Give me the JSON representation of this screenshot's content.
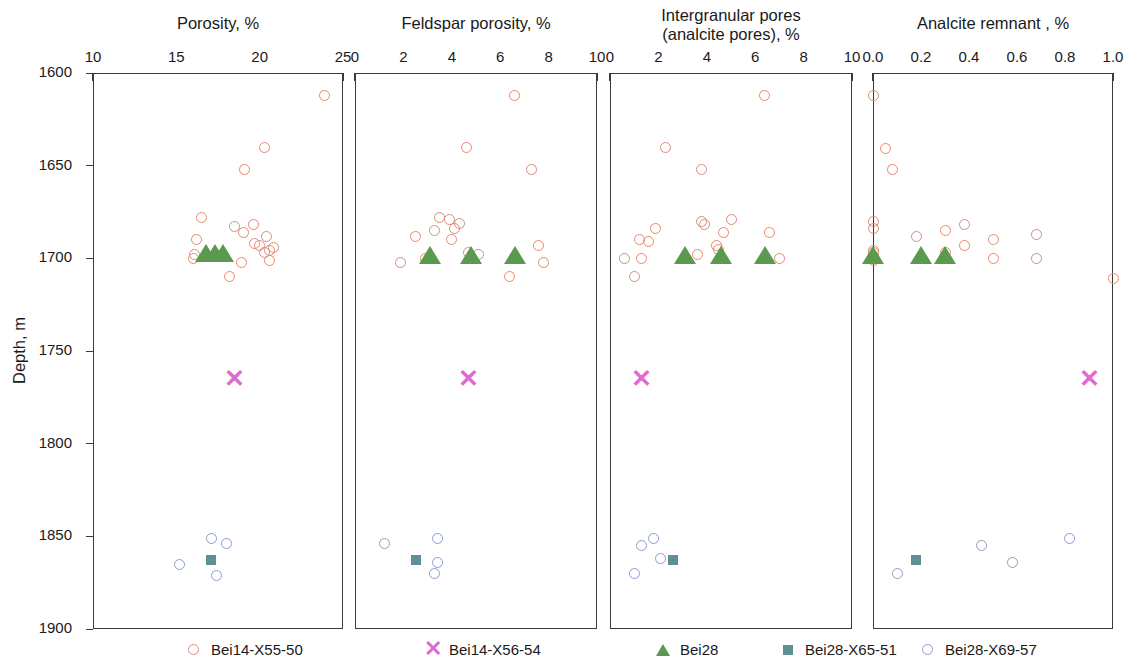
{
  "figure": {
    "y_axis_label": "Depth, m",
    "y_ticks": [
      "1600",
      "1650",
      "1700",
      "1750",
      "1800",
      "1850",
      "1900"
    ],
    "y_min": 1600,
    "y_max": 1900
  },
  "legend": {
    "entries": [
      {
        "label": "Bei14-X55-50",
        "marker": "open-circle",
        "color": "#e08a70"
      },
      {
        "label": "Bei14-X56-54",
        "marker": "cross",
        "color": "#e06bd0"
      },
      {
        "label": "Bei28",
        "marker": "filled-triangle",
        "color": "#5a9a4f"
      },
      {
        "label": "Bei28-X65-51",
        "marker": "filled-square",
        "color": "#5f9098"
      },
      {
        "label": "Bei28-X69-57",
        "marker": "open-circle",
        "color": "#8e9ccc"
      }
    ]
  },
  "chart_data": [
    {
      "type": "scatter",
      "title": "Porosity, %",
      "xlabel": "Porosity, %",
      "ylabel": "Depth, m",
      "xlim": [
        10,
        25
      ],
      "ylim": [
        1900,
        1600
      ],
      "y_inverted": true,
      "xticks": [
        10,
        15,
        20,
        25
      ],
      "xtick_labels": [
        "10",
        "15",
        "20",
        "25"
      ],
      "yticks": [
        1600,
        1650,
        1700,
        1750,
        1800,
        1850,
        1900
      ],
      "grid": false,
      "legend_position": "bottom",
      "series": [
        {
          "name": "Bei14-X55-50",
          "marker": "open-circle",
          "color": "#e08a70",
          "points": [
            [
              23.9,
              1612
            ],
            [
              20.3,
              1640
            ],
            [
              19.1,
              1652
            ],
            [
              16.5,
              1678
            ],
            [
              18.5,
              1683
            ],
            [
              19.6,
              1682
            ],
            [
              19.0,
              1686
            ],
            [
              20.4,
              1688
            ],
            [
              16.2,
              1690
            ],
            [
              19.7,
              1692
            ],
            [
              20.0,
              1693
            ],
            [
              16.1,
              1698
            ],
            [
              16.0,
              1700
            ],
            [
              20.6,
              1696
            ],
            [
              20.3,
              1697
            ],
            [
              20.8,
              1694
            ],
            [
              18.9,
              1702
            ],
            [
              20.6,
              1701
            ],
            [
              18.2,
              1710
            ]
          ]
        },
        {
          "name": "Bei14-X56-54",
          "marker": "cross",
          "color": "#e06bd0",
          "points": [
            [
              18.5,
              1765
            ]
          ]
        },
        {
          "name": "Bei28",
          "marker": "filled-triangle",
          "color": "#5a9a4f",
          "points": [
            [
              16.8,
              1700
            ],
            [
              17.3,
              1700
            ],
            [
              17.8,
              1700
            ]
          ]
        },
        {
          "name": "Bei28-X65-51",
          "marker": "filled-square",
          "color": "#5f9098",
          "points": [
            [
              17.1,
              1863
            ]
          ]
        },
        {
          "name": "Bei28-X69-57",
          "marker": "open-circle",
          "color": "#8e9ccc",
          "points": [
            [
              17.1,
              1851
            ],
            [
              18.0,
              1854
            ],
            [
              15.2,
              1865
            ],
            [
              17.4,
              1871
            ]
          ]
        }
      ]
    },
    {
      "type": "scatter",
      "title": "Feldspar porosity, %",
      "xlabel": "Feldspar porosity, %",
      "ylabel": "Depth, m",
      "xlim": [
        0,
        10
      ],
      "ylim": [
        1900,
        1600
      ],
      "y_inverted": true,
      "xticks": [
        0,
        2,
        4,
        6,
        8,
        10
      ],
      "xtick_labels": [
        "0",
        "2",
        "4",
        "6",
        "8",
        "10"
      ],
      "yticks": [
        1600,
        1650,
        1700,
        1750,
        1800,
        1850,
        1900
      ],
      "grid": false,
      "legend_position": "bottom",
      "series": [
        {
          "name": "Bei14-X55-50",
          "marker": "open-circle",
          "color": "#e08a70",
          "points": [
            [
              6.6,
              1612
            ],
            [
              4.6,
              1640
            ],
            [
              7.3,
              1652
            ],
            [
              3.5,
              1678
            ],
            [
              3.9,
              1679
            ],
            [
              4.3,
              1681
            ],
            [
              3.3,
              1685
            ],
            [
              4.1,
              1684
            ],
            [
              2.5,
              1688
            ],
            [
              4.0,
              1690
            ],
            [
              7.6,
              1693
            ],
            [
              4.7,
              1697
            ],
            [
              5.1,
              1698
            ],
            [
              2.9,
              1700
            ],
            [
              1.9,
              1702
            ],
            [
              7.8,
              1702
            ],
            [
              6.4,
              1710
            ]
          ]
        },
        {
          "name": "Bei14-X56-54",
          "marker": "cross",
          "color": "#e06bd0",
          "points": [
            [
              4.7,
              1765
            ]
          ]
        },
        {
          "name": "Bei28",
          "marker": "filled-triangle",
          "color": "#5a9a4f",
          "points": [
            [
              3.1,
              1701
            ],
            [
              4.8,
              1701
            ],
            [
              6.6,
              1701
            ]
          ]
        },
        {
          "name": "Bei28-X65-51",
          "marker": "filled-square",
          "color": "#5f9098",
          "points": [
            [
              2.5,
              1863
            ]
          ]
        },
        {
          "name": "Bei28-X69-57",
          "marker": "open-circle",
          "color": "#8e9ccc",
          "points": [
            [
              3.4,
              1851
            ],
            [
              1.2,
              1854
            ],
            [
              3.4,
              1864
            ],
            [
              3.3,
              1870
            ]
          ]
        }
      ]
    },
    {
      "type": "scatter",
      "title": "Intergranular pores\n(analcite pores), %",
      "xlabel": "Intergranular pores (analcite pores), %",
      "ylabel": "Depth, m",
      "xlim": [
        0,
        10
      ],
      "ylim": [
        1900,
        1600
      ],
      "y_inverted": true,
      "xticks": [
        0,
        2,
        4,
        6,
        8,
        10
      ],
      "xtick_labels": [
        "0",
        "2",
        "4",
        "6",
        "8",
        "10"
      ],
      "yticks": [
        1600,
        1650,
        1700,
        1750,
        1800,
        1850,
        1900
      ],
      "grid": false,
      "legend_position": "bottom",
      "series": [
        {
          "name": "Bei14-X55-50",
          "marker": "open-circle",
          "color": "#e08a70",
          "points": [
            [
              6.4,
              1612
            ],
            [
              2.3,
              1640
            ],
            [
              3.8,
              1652
            ],
            [
              3.8,
              1680
            ],
            [
              3.9,
              1682
            ],
            [
              5.0,
              1679
            ],
            [
              4.7,
              1686
            ],
            [
              1.9,
              1684
            ],
            [
              6.6,
              1686
            ],
            [
              1.2,
              1690
            ],
            [
              1.6,
              1691
            ],
            [
              4.4,
              1693
            ],
            [
              4.5,
              1695
            ],
            [
              3.6,
              1698
            ],
            [
              0.6,
              1700
            ],
            [
              1.3,
              1700
            ],
            [
              7.0,
              1700
            ],
            [
              1.0,
              1710
            ]
          ]
        },
        {
          "name": "Bei14-X56-54",
          "marker": "cross",
          "color": "#e06bd0",
          "points": [
            [
              1.3,
              1765
            ]
          ]
        },
        {
          "name": "Bei28",
          "marker": "filled-triangle",
          "color": "#5a9a4f",
          "points": [
            [
              3.1,
              1701
            ],
            [
              4.6,
              1701
            ],
            [
              6.4,
              1701
            ]
          ]
        },
        {
          "name": "Bei28-X65-51",
          "marker": "filled-square",
          "color": "#5f9098",
          "points": [
            [
              2.6,
              1863
            ]
          ]
        },
        {
          "name": "Bei28-X69-57",
          "marker": "open-circle",
          "color": "#8e9ccc",
          "points": [
            [
              1.8,
              1851
            ],
            [
              1.3,
              1855
            ],
            [
              2.1,
              1862
            ],
            [
              1.0,
              1870
            ]
          ]
        }
      ]
    },
    {
      "type": "scatter",
      "title": "Analcite remnant , %",
      "xlabel": "Analcite remnant, %",
      "ylabel": "Depth, m",
      "xlim": [
        0.0,
        1.0
      ],
      "ylim": [
        1900,
        1600
      ],
      "y_inverted": true,
      "xticks": [
        0.0,
        0.2,
        0.4,
        0.6,
        0.8,
        1.0
      ],
      "xtick_labels": [
        "0.0",
        "0.2",
        "0.4",
        "0.6",
        "0.8",
        "1.0"
      ],
      "yticks": [
        1600,
        1650,
        1700,
        1750,
        1800,
        1850,
        1900
      ],
      "grid": false,
      "legend_position": "bottom",
      "series": [
        {
          "name": "Bei14-X55-50",
          "marker": "open-circle",
          "color": "#e08a70",
          "points": [
            [
              0.0,
              1612
            ],
            [
              0.05,
              1641
            ],
            [
              0.08,
              1652
            ],
            [
              0.0,
              1680
            ],
            [
              0.0,
              1684
            ],
            [
              0.0,
              1696
            ],
            [
              0.0,
              1697
            ],
            [
              0.0,
              1699
            ],
            [
              0.0,
              1700
            ],
            [
              0.0,
              1701
            ],
            [
              0.18,
              1688
            ],
            [
              0.3,
              1685
            ],
            [
              0.38,
              1682
            ],
            [
              0.38,
              1693
            ],
            [
              0.5,
              1690
            ],
            [
              0.5,
              1700
            ],
            [
              0.68,
              1687
            ],
            [
              0.68,
              1700
            ],
            [
              1.0,
              1711
            ],
            [
              0.3,
              1697
            ]
          ]
        },
        {
          "name": "Bei14-X56-54",
          "marker": "cross",
          "color": "#e06bd0",
          "points": [
            [
              0.9,
              1765
            ]
          ]
        },
        {
          "name": "Bei28",
          "marker": "filled-triangle",
          "color": "#5a9a4f",
          "points": [
            [
              0.0,
              1701
            ],
            [
              0.2,
              1701
            ],
            [
              0.3,
              1701
            ]
          ]
        },
        {
          "name": "Bei28-X65-51",
          "marker": "filled-square",
          "color": "#5f9098",
          "points": [
            [
              0.18,
              1863
            ]
          ]
        },
        {
          "name": "Bei28-X69-57",
          "marker": "open-circle",
          "color": "#8e9ccc",
          "points": [
            [
              0.82,
              1851
            ],
            [
              0.45,
              1855
            ],
            [
              0.58,
              1864
            ],
            [
              0.1,
              1870
            ]
          ]
        }
      ]
    }
  ]
}
